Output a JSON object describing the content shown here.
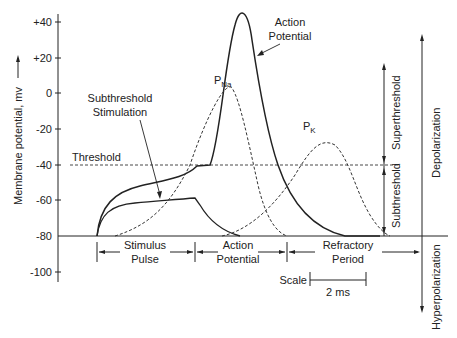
{
  "diagram": {
    "y_axis": {
      "label": "Membrane potential, mv",
      "ticks": [
        "+40",
        "+20",
        "0",
        "-20",
        "-40",
        "-60",
        "-80",
        "-100"
      ]
    },
    "labels": {
      "threshold": "Threshold",
      "subthreshold_stimulation_1": "Subthreshold",
      "subthreshold_stimulation_2": "Stimulation",
      "action_potential_1": "Action",
      "action_potential_2": "Potential",
      "p_na_main": "P",
      "p_na_sub": "Na",
      "p_k_main": "P",
      "p_k_sub": "K",
      "superthreshold": "Superthreshold",
      "subthreshold": "Subthreshold",
      "depolarization": "Depolarization",
      "hyperpolarization": "Hyperpolarization"
    },
    "phases": [
      {
        "line1": "Stimulus",
        "line2": "Pulse"
      },
      {
        "line1": "Action",
        "line2": "Potential"
      },
      {
        "line1": "Refractory",
        "line2": "Period"
      }
    ],
    "scale": {
      "label": "Scale",
      "value": "2 ms"
    }
  }
}
